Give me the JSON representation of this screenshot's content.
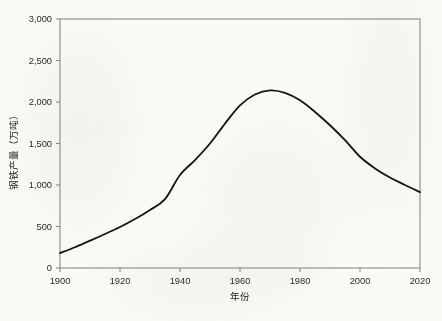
{
  "chart_data": {
    "type": "line",
    "title": "",
    "xlabel": "年份",
    "ylabel": "钢铁产量（万吨）",
    "xlim": [
      1900,
      2020
    ],
    "ylim": [
      0,
      3000
    ],
    "grid": false,
    "legend": null,
    "x_ticks": [
      1900,
      1920,
      1940,
      1960,
      1980,
      2000,
      2020
    ],
    "x_tick_labels": [
      "1900",
      "1920",
      "1940",
      "1960",
      "1980",
      "2000",
      "2020"
    ],
    "y_ticks": [
      0,
      500,
      1000,
      1500,
      2000,
      2500,
      3000
    ],
    "y_tick_labels": [
      "0",
      "500",
      "1,000",
      "1,500",
      "2,000",
      "2,500",
      "3,000"
    ],
    "series": [
      {
        "name": "钢铁产量",
        "color": "#161616",
        "x": [
          1900,
          1905,
          1910,
          1915,
          1920,
          1925,
          1930,
          1935,
          1940,
          1945,
          1950,
          1955,
          1960,
          1965,
          1970,
          1975,
          1980,
          1985,
          1990,
          1995,
          2000,
          2005,
          2010,
          2015,
          2020
        ],
        "values": [
          180,
          250,
          330,
          410,
          494,
          590,
          700,
          830,
          1120,
          1300,
          1500,
          1740,
          1960,
          2090,
          2140,
          2110,
          2020,
          1880,
          1720,
          1540,
          1340,
          1200,
          1090,
          1000,
          915
        ]
      }
    ],
    "annotations": {
      "peak_year": 1970,
      "peak_value": 2140,
      "start_value": 180,
      "end_value": 915
    },
    "colors": {
      "curve": "#161616",
      "axis": "#8a8a8a",
      "text": "#2a2a2a",
      "background": "#fbfaf7"
    }
  }
}
